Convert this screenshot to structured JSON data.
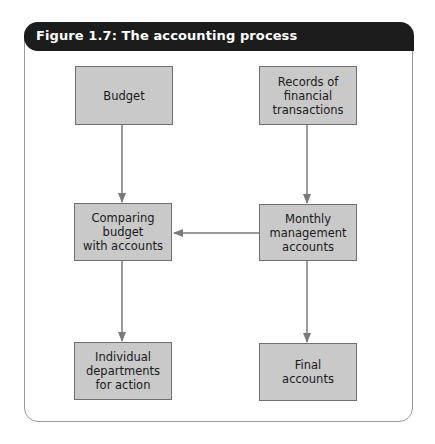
{
  "figure": {
    "title": "Figure 1.7: The accounting process"
  },
  "nodes": [
    {
      "id": "budget",
      "label": "Budget"
    },
    {
      "id": "records",
      "label": "Records of\nfinancial\ntransactions"
    },
    {
      "id": "comparing",
      "label": "Comparing budget\nwith accounts"
    },
    {
      "id": "monthly",
      "label": "Monthly\nmanagement\naccounts"
    },
    {
      "id": "individual",
      "label": "Individual\ndepartments\nfor action"
    },
    {
      "id": "final",
      "label": "Final\naccounts"
    }
  ],
  "edges": [
    {
      "from": "budget",
      "to": "comparing"
    },
    {
      "from": "records",
      "to": "monthly"
    },
    {
      "from": "monthly",
      "to": "comparing"
    },
    {
      "from": "comparing",
      "to": "individual"
    },
    {
      "from": "monthly",
      "to": "final"
    }
  ],
  "colors": {
    "header_bg": "#1c1c1c",
    "box_fill": "#c9c9c9",
    "box_border": "#6f6f6f",
    "arrow": "#7a7a7a"
  }
}
